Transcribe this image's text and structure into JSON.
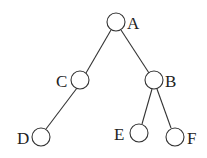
{
  "diagram": {
    "type": "binary-tree",
    "nodes": [
      {
        "id": "A",
        "label": "A",
        "cx": 116,
        "cy": 22,
        "r": 9,
        "lx": 128,
        "ly": 29
      },
      {
        "id": "C",
        "label": "C",
        "cx": 80,
        "cy": 80,
        "r": 9,
        "lx": 55,
        "ly": 87
      },
      {
        "id": "B",
        "label": "B",
        "cx": 154,
        "cy": 80,
        "r": 9,
        "lx": 166,
        "ly": 87
      },
      {
        "id": "D",
        "label": "D",
        "cx": 41,
        "cy": 137,
        "r": 9,
        "lx": 17,
        "ly": 144
      },
      {
        "id": "E",
        "label": "E",
        "cx": 139,
        "cy": 133,
        "r": 9,
        "lx": 113,
        "ly": 140
      },
      {
        "id": "F",
        "label": "F",
        "cx": 175,
        "cy": 137,
        "r": 9,
        "lx": 188,
        "ly": 144
      }
    ],
    "edges": [
      {
        "from": "A",
        "to": "C"
      },
      {
        "from": "A",
        "to": "B"
      },
      {
        "from": "C",
        "to": "D"
      },
      {
        "from": "B",
        "to": "E"
      },
      {
        "from": "B",
        "to": "F"
      }
    ]
  }
}
